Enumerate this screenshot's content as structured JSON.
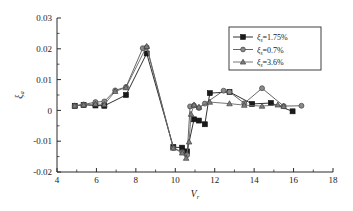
{
  "chart_data": {
    "type": "line",
    "title": "",
    "xlabel": "V_r",
    "xlabel_base": "V",
    "xlabel_sub": "r",
    "ylabel": "ξ_a",
    "ylabel_base": "ξ",
    "ylabel_sub": "a",
    "xlim": [
      4,
      18
    ],
    "ylim": [
      -0.02,
      0.03
    ],
    "xticks": [
      4,
      6,
      8,
      10,
      12,
      14,
      16,
      18
    ],
    "xtick_labels": [
      "4",
      "6",
      "8",
      "10",
      "12",
      "14",
      "16",
      "18"
    ],
    "xminor_step": 1,
    "yticks": [
      -0.02,
      -0.01,
      0,
      0.01,
      0.02,
      0.03
    ],
    "ytick_labels": [
      "-0.02",
      "-0.01",
      "0",
      "0.01",
      "0.02",
      "0.03"
    ],
    "yminor_step": 0.005,
    "grid": false,
    "legend_position": "top-right",
    "series": [
      {
        "name": "ξ_s=1.75%",
        "label_base": "ξ",
        "label_sub": "s",
        "label_value": "=1.75%",
        "marker": "square",
        "color": "#1a1a1a",
        "points": [
          [
            4.9,
            0.0015
          ],
          [
            5.35,
            0.0018
          ],
          [
            5.95,
            0.0016
          ],
          [
            6.4,
            0.0015
          ],
          [
            7.5,
            0.005
          ],
          [
            8.55,
            0.0185
          ],
          [
            9.9,
            -0.0119
          ],
          [
            10.35,
            -0.0121
          ],
          [
            10.6,
            -0.0133
          ],
          [
            10.95,
            -0.0029
          ],
          [
            11.2,
            -0.0033
          ],
          [
            11.5,
            -0.0045
          ],
          [
            11.75,
            0.0056
          ],
          [
            12.75,
            0.006
          ],
          [
            13.9,
            0.0021
          ],
          [
            14.85,
            0.0024
          ],
          [
            15.95,
            -0.0003
          ]
        ]
      },
      {
        "name": "ξ_s=0.7%",
        "label_base": "ξ",
        "label_sub": "s",
        "label_value": "=0.7%",
        "marker": "circle",
        "color": "#555555",
        "points": [
          [
            4.9,
            0.0015
          ],
          [
            5.35,
            0.0019
          ],
          [
            5.95,
            0.0027
          ],
          [
            6.4,
            0.0029
          ],
          [
            6.95,
            0.0065
          ],
          [
            7.5,
            0.0076
          ],
          [
            8.35,
            0.0202
          ],
          [
            8.55,
            0.0205
          ],
          [
            9.9,
            -0.0122
          ],
          [
            10.35,
            -0.0135
          ],
          [
            10.6,
            -0.0145
          ],
          [
            10.75,
            0.0013
          ],
          [
            10.95,
            0.0016
          ],
          [
            11.2,
            0.0008
          ],
          [
            11.5,
            0.0022
          ],
          [
            12.45,
            0.0064
          ],
          [
            12.75,
            0.006
          ],
          [
            13.5,
            0.0023
          ],
          [
            14.4,
            0.0072
          ],
          [
            15.5,
            0.0014
          ],
          [
            16.4,
            0.0015
          ]
        ]
      },
      {
        "name": "ξ_s=3.6%",
        "label_base": "ξ",
        "label_sub": "s",
        "label_value": "=3.6%",
        "marker": "triangle",
        "color": "#666666",
        "points": [
          [
            4.9,
            0.0015
          ],
          [
            5.35,
            0.0018
          ],
          [
            5.95,
            0.0021
          ],
          [
            6.4,
            0.0019
          ],
          [
            6.95,
            0.0062
          ],
          [
            7.5,
            0.0074
          ],
          [
            8.55,
            0.0208
          ],
          [
            9.9,
            -0.0122
          ],
          [
            10.35,
            -0.0138
          ],
          [
            10.55,
            -0.0155
          ],
          [
            10.7,
            -0.0102
          ],
          [
            10.8,
            -0.0012
          ],
          [
            10.95,
            0.0018
          ],
          [
            11.2,
            0.0011
          ],
          [
            11.75,
            0.0027
          ],
          [
            12.75,
            0.0022
          ],
          [
            13.5,
            0.0017
          ],
          [
            14.4,
            0.0014
          ],
          [
            15.2,
            0.0018
          ],
          [
            15.5,
            0.0013
          ]
        ]
      }
    ]
  }
}
